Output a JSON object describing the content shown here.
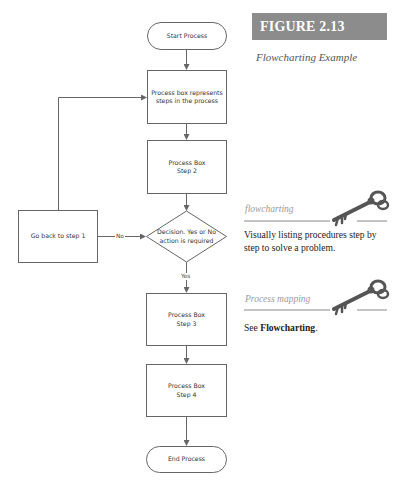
{
  "figure": {
    "label": "FIGURE 2.13",
    "caption": "Flowcharting Example",
    "banner_color": "#8c8c8c"
  },
  "flowchart": {
    "nodes": {
      "start": {
        "shape": "terminator",
        "text": "Start Process"
      },
      "process1": {
        "shape": "process",
        "text": "Process box represents\nsteps in the process"
      },
      "process2": {
        "shape": "process",
        "text": "Process Box\nStep 2"
      },
      "decision": {
        "shape": "decision",
        "text": "Decision.  Yes or No\naction is required"
      },
      "goback": {
        "shape": "process",
        "text": "Go back to step 1"
      },
      "process3": {
        "shape": "process",
        "text": "Process Box\nStep 3"
      },
      "process4": {
        "shape": "process",
        "text": "Process Box\nStep 4"
      },
      "end": {
        "shape": "terminator",
        "text": "End Process"
      }
    },
    "edges": [
      {
        "from": "start",
        "to": "process1",
        "label": ""
      },
      {
        "from": "process1",
        "to": "process2",
        "label": ""
      },
      {
        "from": "process2",
        "to": "decision",
        "label": ""
      },
      {
        "from": "goback",
        "to": "decision",
        "label": "No"
      },
      {
        "from": "goback",
        "to": "process1",
        "label": ""
      },
      {
        "from": "decision",
        "to": "process3",
        "label": "Yes"
      },
      {
        "from": "process3",
        "to": "process4",
        "label": ""
      },
      {
        "from": "process4",
        "to": "end",
        "label": ""
      }
    ],
    "line_color": "#666666"
  },
  "sidebar": {
    "terms": [
      {
        "term": "flowcharting",
        "icon": "key-icon",
        "definition": "Visually listing procedures step by step to solve a problem."
      },
      {
        "term": "Process mapping",
        "icon": "key-icon",
        "definition_prefix": "See ",
        "definition_link": "Flowcharting",
        "definition_suffix": "."
      }
    ]
  }
}
